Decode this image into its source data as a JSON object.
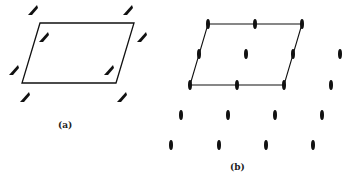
{
  "figure_a": {
    "label": "(a)",
    "label_pos": [
      58,
      120
    ],
    "parallelogram": [
      [
        40,
        23
      ],
      [
        134,
        23
      ],
      [
        116,
        83
      ],
      [
        22,
        83
      ]
    ],
    "markers": [
      [
        33,
        10
      ],
      [
        128,
        10
      ],
      [
        44,
        37
      ],
      [
        142,
        37
      ],
      [
        14,
        70
      ],
      [
        109,
        70
      ],
      [
        25,
        97
      ],
      [
        122,
        97
      ]
    ]
  },
  "figure_b": {
    "label": "(b)",
    "label_pos": [
      230,
      162
    ],
    "cell_outline": [
      [
        208,
        24
      ],
      [
        302,
        24
      ],
      [
        284,
        85
      ],
      [
        190,
        85
      ]
    ],
    "lenses": [
      [
        208,
        24
      ],
      [
        255,
        24
      ],
      [
        302,
        24
      ],
      [
        199,
        54
      ],
      [
        246,
        54
      ],
      [
        293,
        54
      ],
      [
        340,
        54
      ],
      [
        190,
        85
      ],
      [
        237,
        85
      ],
      [
        284,
        85
      ],
      [
        331,
        85
      ],
      [
        181,
        115
      ],
      [
        228,
        115
      ],
      [
        275,
        115
      ],
      [
        322,
        115
      ],
      [
        171,
        145
      ],
      [
        219,
        145
      ],
      [
        266,
        145
      ],
      [
        313,
        145
      ]
    ]
  },
  "colors": {
    "ink": "#111111",
    "background": "#ffffff"
  }
}
